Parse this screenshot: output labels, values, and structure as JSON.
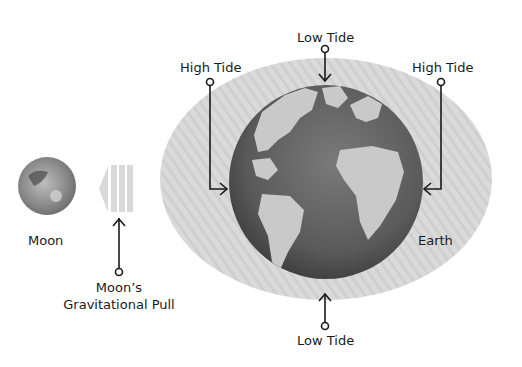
{
  "diagram": {
    "labels": {
      "moon": "Moon",
      "earth": "Earth",
      "pull_line1": "Moon’s",
      "pull_line2": "Gravitational Pull",
      "high_tide_left": "High Tide",
      "high_tide_right": "High Tide",
      "low_tide_top": "Low Tide",
      "low_tide_bottom": "Low Tide"
    },
    "colors": {
      "tidal_bulge": "#d9d9d9",
      "ocean": "#5e5e5e",
      "land": "#c8c8c8",
      "moon": "#8a8a8a",
      "line": "#1a1a1a"
    }
  }
}
